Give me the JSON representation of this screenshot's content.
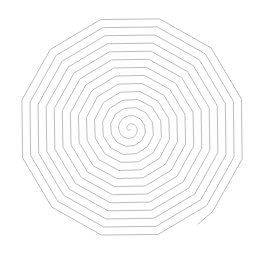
{
  "figure": {
    "type": "polygonal-spiral",
    "sides_per_turn": 12,
    "center": [
      130,
      129
    ],
    "turns": 14,
    "spacing_px": 8.2,
    "outer_radius_px": 117,
    "end_point": [
      199,
      226
    ],
    "stroke_color": "#b4b4b4",
    "background_color": "#ffffff"
  }
}
